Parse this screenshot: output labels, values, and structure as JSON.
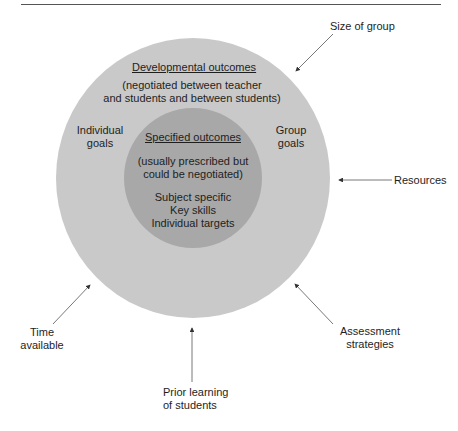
{
  "diagram": {
    "colors": {
      "outer_circle": "#c9c9c9",
      "inner_circle": "#a8a8a8",
      "arrow": "#444444",
      "text": "#1e1e1e"
    },
    "outer_circle": {
      "title": "Developmental outcomes",
      "subtitle_line1": "(negotiated between teacher",
      "subtitle_line2": "and students and between students)",
      "left_label_line1": "Individual",
      "left_label_line2": "goals",
      "right_label_line1": "Group",
      "right_label_line2": "goals"
    },
    "inner_circle": {
      "title": "Specified outcomes",
      "note_line1": "(usually prescribed but",
      "note_line2": "could be negotiated)",
      "items": [
        "Subject specific",
        "Key skills",
        "Individual targets"
      ]
    },
    "influences": [
      {
        "label_line1": "Size of group",
        "label_line2": ""
      },
      {
        "label_line1": "Resources",
        "label_line2": ""
      },
      {
        "label_line1": "Assessment",
        "label_line2": "strategies"
      },
      {
        "label_line1": "Prior learning",
        "label_line2": "of students"
      },
      {
        "label_line1": "Time",
        "label_line2": "available"
      }
    ]
  }
}
